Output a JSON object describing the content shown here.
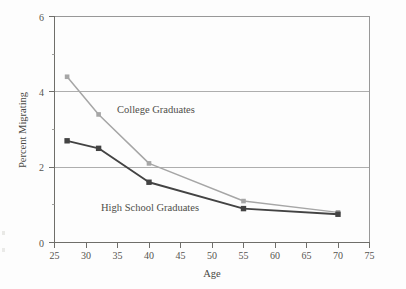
{
  "chart_data": {
    "type": "line",
    "title": "",
    "xlabel": "Age",
    "ylabel": "Percent Migrating",
    "xlim": [
      25,
      75
    ],
    "ylim": [
      0,
      6
    ],
    "xticks": [
      25,
      30,
      35,
      40,
      45,
      50,
      55,
      60,
      65,
      70,
      75
    ],
    "yticks": [
      0,
      2,
      4,
      6
    ],
    "grid": "horizontal-major-only",
    "legend": "inline-annotations",
    "series": [
      {
        "name": "College Graduates",
        "color": "#a6a6a6",
        "marker": "square",
        "x": [
          27,
          32,
          40,
          55,
          70
        ],
        "values": [
          4.4,
          3.4,
          2.1,
          1.1,
          0.8
        ]
      },
      {
        "name": "High School Graduates",
        "color": "#434343",
        "marker": "square",
        "x": [
          27,
          32,
          40,
          55,
          70
        ],
        "values": [
          2.7,
          2.5,
          1.6,
          0.9,
          0.75
        ]
      }
    ],
    "annotations": [
      {
        "text": "College Graduates",
        "x": 38.5,
        "y": 3.55
      },
      {
        "text": "High School Graduates",
        "x": 35.5,
        "y": 1.3
      }
    ]
  },
  "axes": {
    "y_tick_labels": [
      "6",
      "4",
      "2",
      "0"
    ],
    "x_tick_labels": [
      "25",
      "30",
      "35",
      "40",
      "45",
      "50",
      "55",
      "60",
      "65",
      "70",
      "75"
    ],
    "x_title": "Age",
    "y_title": "Percent Migrating"
  },
  "labels": {
    "college": "College Graduates",
    "highschool": "High School Graduates"
  },
  "colors": {
    "college_line": "#a6a6a6",
    "highschool_line": "#434343",
    "gridline": "#9a9a9a",
    "frame": "#8d8d8d",
    "text": "#4f4e4a",
    "background": "#fdfdfd"
  }
}
